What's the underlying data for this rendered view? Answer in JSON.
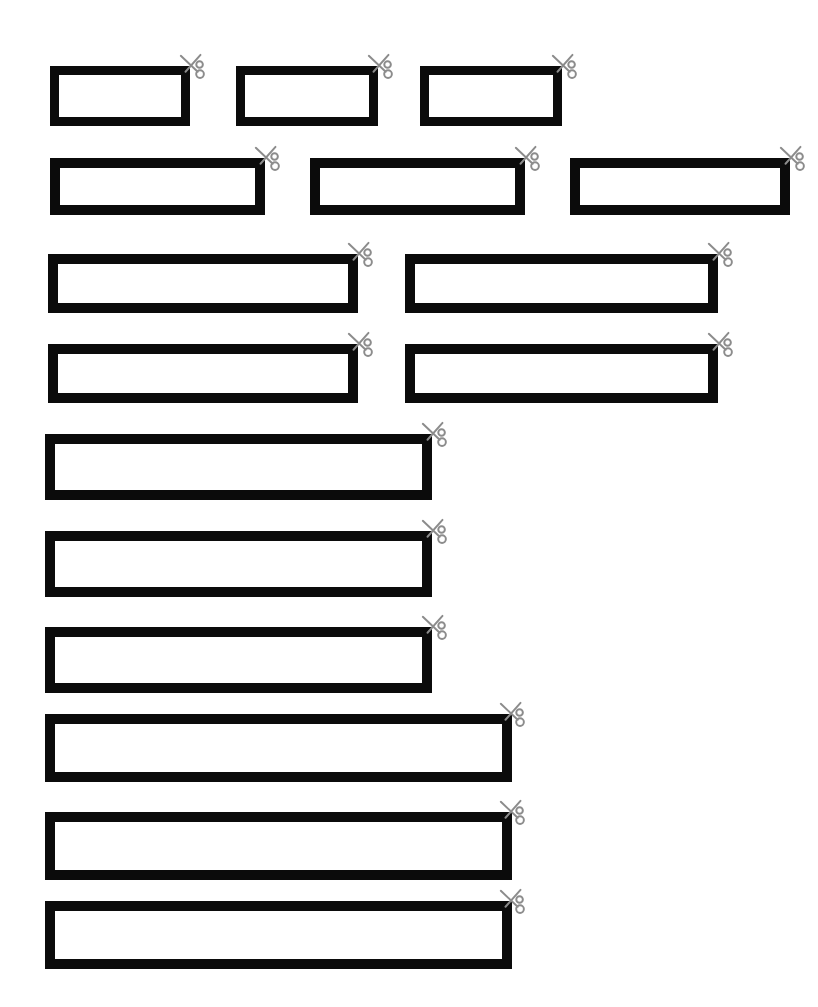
{
  "page": {
    "width": 818,
    "height": 1007,
    "background_color": "#ffffff",
    "ink_color": "#0b0b0b",
    "scissors_color": "#8c8c8c",
    "icon_name": "scissors-icon",
    "strip_count": 15,
    "row_count": 9
  },
  "rows": [
    {
      "index": 1,
      "strips_in_row": 3,
      "strips": [
        {
          "label": "strip-1",
          "x": 50,
          "y": 66,
          "w": 140,
          "h": 60,
          "border": 9,
          "scissors_x": 178,
          "scissors_y": 53
        },
        {
          "label": "strip-2",
          "x": 236,
          "y": 66,
          "w": 142,
          "h": 60,
          "border": 9,
          "scissors_x": 366,
          "scissors_y": 53
        },
        {
          "label": "strip-3",
          "x": 420,
          "y": 66,
          "w": 142,
          "h": 60,
          "border": 9,
          "scissors_x": 550,
          "scissors_y": 53
        }
      ]
    },
    {
      "index": 2,
      "strips_in_row": 3,
      "strips": [
        {
          "label": "strip-4",
          "x": 50,
          "y": 158,
          "w": 215,
          "h": 57,
          "border": 10,
          "scissors_x": 253,
          "scissors_y": 145
        },
        {
          "label": "strip-5",
          "x": 310,
          "y": 158,
          "w": 215,
          "h": 57,
          "border": 10,
          "scissors_x": 513,
          "scissors_y": 145
        },
        {
          "label": "strip-6",
          "x": 570,
          "y": 158,
          "w": 220,
          "h": 57,
          "border": 10,
          "scissors_x": 778,
          "scissors_y": 145
        }
      ]
    },
    {
      "index": 3,
      "strips_in_row": 2,
      "strips": [
        {
          "label": "strip-7",
          "x": 48,
          "y": 254,
          "w": 310,
          "h": 59,
          "border": 10,
          "scissors_x": 346,
          "scissors_y": 241
        },
        {
          "label": "strip-8",
          "x": 405,
          "y": 254,
          "w": 313,
          "h": 59,
          "border": 10,
          "scissors_x": 706,
          "scissors_y": 241
        }
      ]
    },
    {
      "index": 4,
      "strips_in_row": 2,
      "strips": [
        {
          "label": "strip-9",
          "x": 48,
          "y": 344,
          "w": 310,
          "h": 59,
          "border": 10,
          "scissors_x": 346,
          "scissors_y": 331
        },
        {
          "label": "strip-10",
          "x": 405,
          "y": 344,
          "w": 313,
          "h": 59,
          "border": 10,
          "scissors_x": 706,
          "scissors_y": 331
        }
      ]
    },
    {
      "index": 5,
      "strips_in_row": 1,
      "strips": [
        {
          "label": "strip-11",
          "x": 45,
          "y": 434,
          "w": 387,
          "h": 66,
          "border": 10,
          "scissors_x": 420,
          "scissors_y": 421
        }
      ]
    },
    {
      "index": 6,
      "strips_in_row": 1,
      "strips": [
        {
          "label": "strip-12",
          "x": 45,
          "y": 531,
          "w": 387,
          "h": 66,
          "border": 10,
          "scissors_x": 420,
          "scissors_y": 518
        }
      ]
    },
    {
      "index": 7,
      "strips_in_row": 1,
      "strips": [
        {
          "label": "strip-13",
          "x": 45,
          "y": 627,
          "w": 387,
          "h": 66,
          "border": 10,
          "scissors_x": 420,
          "scissors_y": 614
        }
      ]
    },
    {
      "index": 8,
      "strips_in_row": 1,
      "strips": [
        {
          "label": "strip-14",
          "x": 45,
          "y": 714,
          "w": 467,
          "h": 68,
          "border": 10,
          "scissors_x": 498,
          "scissors_y": 701
        }
      ]
    },
    {
      "index": 9,
      "strips_in_row": 1,
      "strips": [
        {
          "label": "strip-15",
          "x": 45,
          "y": 812,
          "w": 467,
          "h": 68,
          "border": 10,
          "scissors_x": 498,
          "scissors_y": 799
        }
      ]
    },
    {
      "index": 10,
      "strips_in_row": 1,
      "strips": [
        {
          "label": "strip-16",
          "x": 45,
          "y": 901,
          "w": 467,
          "h": 68,
          "border": 10,
          "scissors_x": 498,
          "scissors_y": 888
        }
      ]
    }
  ]
}
